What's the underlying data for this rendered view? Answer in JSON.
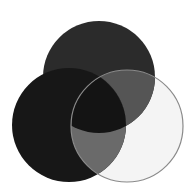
{
  "diagram": {
    "type": "venn",
    "set_count": 3,
    "background": "#ffffff",
    "sets": [
      {
        "id": "top",
        "cx": 99,
        "cy": 77,
        "r": 56,
        "fill": "#2b2b2b",
        "stroke": "#2b2b2b"
      },
      {
        "id": "right",
        "cx": 127,
        "cy": 126,
        "r": 56,
        "fill": "#f4f4f4",
        "stroke": "#8a8a8a"
      },
      {
        "id": "left",
        "cx": 69,
        "cy": 125,
        "r": 57,
        "fill": "#171717",
        "stroke": "#171717"
      }
    ],
    "regions": {
      "top_right": "#555555",
      "left_right": "#6a6a6a",
      "left_top": "#141414",
      "all_three": "#141414"
    },
    "labels": []
  }
}
